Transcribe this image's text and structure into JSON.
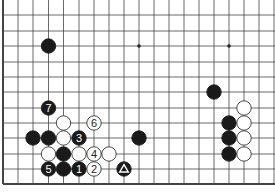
{
  "board": {
    "cols_x": [
      3,
      18,
      33,
      48.5,
      63.5,
      79,
      94,
      109,
      124,
      139,
      154,
      169,
      184,
      199,
      214,
      229,
      244,
      259,
      274
    ],
    "rows_y": [
      0,
      15,
      31,
      46,
      62,
      77,
      92,
      108,
      123,
      138,
      154,
      169,
      184
    ],
    "left_edge": true,
    "bottom_edge": true,
    "star_points": [
      [
        9,
        3
      ],
      [
        15,
        3
      ]
    ],
    "stones": [
      {
        "c": 3,
        "r": 3,
        "color": "black",
        "label": ""
      },
      {
        "c": 14,
        "r": 6,
        "color": "black",
        "label": ""
      },
      {
        "c": 3,
        "r": 7,
        "color": "black",
        "label": "7"
      },
      {
        "c": 4,
        "r": 8,
        "color": "white",
        "label": ""
      },
      {
        "c": 6,
        "r": 8,
        "color": "white",
        "label": "6"
      },
      {
        "c": 16,
        "r": 7,
        "color": "white",
        "label": ""
      },
      {
        "c": 2,
        "r": 9,
        "color": "black",
        "label": ""
      },
      {
        "c": 3,
        "r": 9,
        "color": "black",
        "label": ""
      },
      {
        "c": 4,
        "r": 9,
        "color": "white",
        "label": ""
      },
      {
        "c": 5,
        "r": 9,
        "color": "black",
        "label": "3"
      },
      {
        "c": 9,
        "r": 9,
        "color": "black",
        "label": ""
      },
      {
        "c": 15,
        "r": 8,
        "color": "black",
        "label": ""
      },
      {
        "c": 16,
        "r": 8,
        "color": "white",
        "label": ""
      },
      {
        "c": 15,
        "r": 9,
        "color": "black",
        "label": ""
      },
      {
        "c": 16,
        "r": 9,
        "color": "white",
        "label": ""
      },
      {
        "c": 3,
        "r": 10,
        "color": "white",
        "label": ""
      },
      {
        "c": 4,
        "r": 10,
        "color": "black",
        "label": ""
      },
      {
        "c": 5,
        "r": 10,
        "color": "white",
        "label": ""
      },
      {
        "c": 6,
        "r": 10,
        "color": "white",
        "label": "4"
      },
      {
        "c": 7,
        "r": 10,
        "color": "white",
        "label": ""
      },
      {
        "c": 15,
        "r": 10,
        "color": "black",
        "label": ""
      },
      {
        "c": 16,
        "r": 10,
        "color": "white",
        "label": ""
      },
      {
        "c": 3,
        "r": 11,
        "color": "black",
        "label": "5"
      },
      {
        "c": 4,
        "r": 11,
        "color": "black",
        "label": ""
      },
      {
        "c": 5,
        "r": 11,
        "color": "black",
        "label": "1"
      },
      {
        "c": 6,
        "r": 11,
        "color": "white",
        "label": "2"
      },
      {
        "c": 8,
        "r": 11,
        "color": "black",
        "label": "triangle"
      }
    ]
  }
}
